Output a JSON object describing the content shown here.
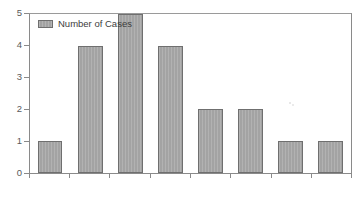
{
  "chart_data": {
    "type": "bar",
    "title": "",
    "subtitle": "",
    "xlabel": "",
    "ylabel": "",
    "categories": [
      "1",
      "2",
      "3",
      "4",
      "5",
      "6",
      "7",
      "8"
    ],
    "values": [
      1,
      4,
      5,
      4,
      2,
      2,
      1,
      1
    ],
    "series": [
      {
        "name": "Number of Cases",
        "values": [
          1,
          4,
          5,
          4,
          2,
          2,
          1,
          1
        ]
      }
    ],
    "ylim": [
      0,
      5
    ],
    "yticks": [
      0,
      1,
      2,
      3,
      4,
      5
    ],
    "ytick_labels": [
      "0",
      "1",
      "2",
      "3",
      "4",
      "5"
    ],
    "xtick_labels": [
      "",
      "",
      "",
      "",
      "",
      "",
      "",
      "",
      ""
    ],
    "grid": false,
    "legend": {
      "entries": [
        "Number of Cases"
      ],
      "position": "top-left-inside"
    },
    "colors": {
      "bar_fill": "#a3a3a3",
      "bar_border": "#6f6f6f",
      "axis": "#8a8a8a",
      "text": "#5a5a5a",
      "background": "#ffffff"
    }
  },
  "legend": {
    "label": "Number of Cases"
  },
  "axes": {
    "y_labels": [
      "5",
      "4",
      "3",
      "2",
      "1",
      "0"
    ]
  }
}
